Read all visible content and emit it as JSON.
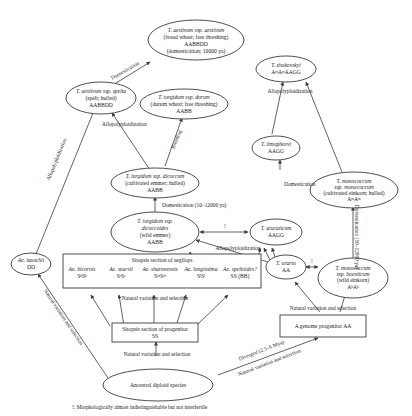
{
  "nodes": {
    "aestivum": {
      "l1": "T. aestivum ssp. aestivum",
      "l2": "(bread wheat; free threshing)",
      "l3": "AABBDD",
      "l4": "(domestication; 10000 ya)"
    },
    "spelta": {
      "l1": "T. aestivum ssp. spelta",
      "l2": "(spelt; hulled)",
      "l3": "AABBDD"
    },
    "durum": {
      "l1": "T. turgidum ssp. durum",
      "l2": "(durum wheat; free threshing)",
      "l3": "AABB"
    },
    "zhukovskyi": {
      "l1": "T. zhukovskyi",
      "l2": "AᵐAᵐAAGG"
    },
    "dicoccum": {
      "l1": "T. turgidum ssp. dicoccum",
      "l2": "(cultivated emmer; hulled)",
      "l3": "AABB"
    },
    "timopheevi": {
      "l1": "T. timopheevi",
      "l2": "AAGG"
    },
    "monococcum": {
      "l1": "T. monococcum",
      "l2": "ssp. monococcum",
      "l3": "(cultivated einkorn; hulled)",
      "l4": "AᵐAᵐ"
    },
    "dicoccoides": {
      "l1": "T. turgidum ssp.",
      "l2": "dicoccoides",
      "l3": "(wild emmer)",
      "l4": "AABB"
    },
    "araraticum": {
      "l1": "T. araraticum",
      "l2": "AAGG"
    },
    "tauschii": {
      "l1": "Ae. tauschii",
      "l2": "DD"
    },
    "urartu": {
      "l1": "T. urartu",
      "l2": "AA"
    },
    "boeoticum": {
      "l1": "T. monococcum",
      "l2": "ssp. boeoticum",
      "l3": "(wild einkorn)",
      "l4": "AᵇAᵇ"
    },
    "sitopsis_aegilops": {
      "title": "Sitopsis section of aegilops",
      "species": [
        {
          "name": "Ae. bicornis",
          "genome": "SᵇSᵇ"
        },
        {
          "name": "Ae. searsii",
          "genome": "SˢSˢ"
        },
        {
          "name": "Ae. sharonensis",
          "genome": "SˢʰSˢʰ"
        },
        {
          "name": "Ae. longissima",
          "genome": "SˡSˡ"
        },
        {
          "name": "Ae. speltoides?",
          "genome": "SS (BB)"
        }
      ]
    },
    "sitopsis_progenitor": {
      "l1": "Sitopsis section of progenitor",
      "l2": "SS"
    },
    "a_progenitor": {
      "l1": "A genome progenitor AA"
    },
    "ancestral": {
      "l1": "Ancestral diploid species"
    }
  },
  "edge_labels": {
    "domestication_top": "Domestication",
    "allopoly_spelta": "Allopolyploidization",
    "breeding": "Breeding",
    "allopoly_zhuk": "Allopolyploidization",
    "domest_emmer": "Domestication (10–12000 ya)",
    "domest_timo": "Domestication",
    "domest_einkorn": "Domestication (10–12000 ya)",
    "question": "!",
    "question2": "!",
    "allopoly_arar": "Allopolyploidization",
    "allopoly_left": "Allopolyploidization",
    "nat_var_sitopsis": "Natural variation and selection",
    "nat_var_aprog": "Natural variation and selection",
    "nat_var_prog": "Natural variation and selection",
    "nat_var_left": "Natural variation and selection",
    "diverged": "Diverged (2.5–6 Mya)",
    "nat_var_right": "Natural variation and selection"
  },
  "footnote": "!: Morphologically almost indistinguishable but not interfertile"
}
